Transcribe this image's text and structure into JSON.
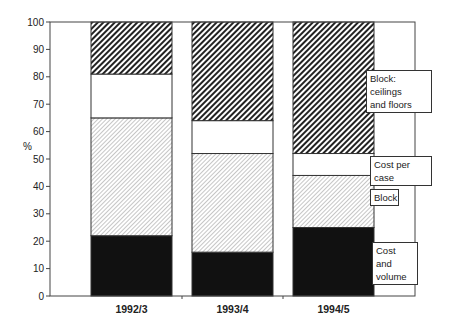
{
  "chart_data": {
    "type": "bar",
    "stacked": true,
    "title": "",
    "xlabel": "",
    "ylabel": "%",
    "ylim": [
      0,
      100
    ],
    "yticks": [
      0,
      10,
      20,
      30,
      40,
      50,
      60,
      70,
      80,
      90,
      100
    ],
    "grid": false,
    "legend_position": "right (inline annotation boxes)",
    "categories": [
      "1992/3",
      "1993/4",
      "1994/5"
    ],
    "series": [
      {
        "name": "Cost and volume",
        "fill": "solid-black",
        "values": [
          22,
          16,
          25
        ]
      },
      {
        "name": "Block",
        "fill": "light-diagonal-hatch",
        "values": [
          43,
          36,
          19
        ]
      },
      {
        "name": "Cost per case",
        "fill": "white",
        "values": [
          16,
          12,
          8
        ]
      },
      {
        "name": "Block: ceilings and floors",
        "fill": "dark-diagonal-hatch",
        "values": [
          19,
          36,
          48
        ]
      }
    ],
    "cumulative_tops": {
      "1992/3": [
        22,
        65,
        81,
        100
      ],
      "1993/4": [
        16,
        52,
        64,
        100
      ],
      "1994/5": [
        25,
        44,
        52,
        100
      ]
    }
  },
  "annotations": {
    "ceilings_line1": "Block: ceilings",
    "ceilings_line2": "and floors",
    "cost_per_case": "Cost per case",
    "block": "Block",
    "cost_volume_line1": "Cost and",
    "cost_volume_line2": "volume"
  },
  "colors": {
    "black": "#111111",
    "dark_hatch": "#222222",
    "light_hatch": "#b8b8b8",
    "frame": "#444444"
  }
}
